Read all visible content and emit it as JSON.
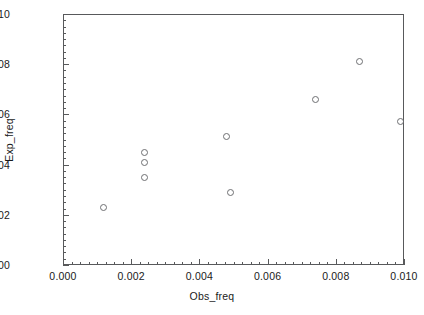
{
  "chart_data": {
    "type": "scatter",
    "title": "",
    "xlabel": "Obs_freq",
    "ylabel": "Exp_freq",
    "xlim": [
      0.0,
      0.01
    ],
    "ylim": [
      0.0,
      0.01
    ],
    "grid": false,
    "legend": null,
    "marker": "open-circle",
    "marker_color": "#6e6f72",
    "frame_color": "#58595b",
    "x_ticks": [
      0.0,
      0.002,
      0.004,
      0.006,
      0.008,
      0.01
    ],
    "y_ticks": [
      0.0,
      0.002,
      0.004,
      0.006,
      0.008,
      0.01
    ],
    "x_tick_labels": [
      "0.000",
      "0.002",
      "0.004",
      "0.006",
      "0.008",
      "0.010"
    ],
    "y_tick_labels": [
      "0.000",
      "0.002",
      "0.004",
      "0.006",
      "0.008",
      "0.010"
    ],
    "x_minor_tick_step": 0.00025,
    "y_minor_tick_step": 0.00025,
    "points": [
      {
        "x": 0.0012,
        "y": 0.0023
      },
      {
        "x": 0.0024,
        "y": 0.0045
      },
      {
        "x": 0.0024,
        "y": 0.0041
      },
      {
        "x": 0.0024,
        "y": 0.0035
      },
      {
        "x": 0.0048,
        "y": 0.0051
      },
      {
        "x": 0.0049,
        "y": 0.0029
      },
      {
        "x": 0.0074,
        "y": 0.0066
      },
      {
        "x": 0.0087,
        "y": 0.0081
      },
      {
        "x": 0.0099,
        "y": 0.0057
      }
    ],
    "x": [
      0.0012,
      0.0024,
      0.0024,
      0.0024,
      0.0048,
      0.0049,
      0.0074,
      0.0087,
      0.0099
    ],
    "values": [
      0.0023,
      0.0045,
      0.0041,
      0.0035,
      0.0051,
      0.0029,
      0.0066,
      0.0081,
      0.0057
    ]
  }
}
